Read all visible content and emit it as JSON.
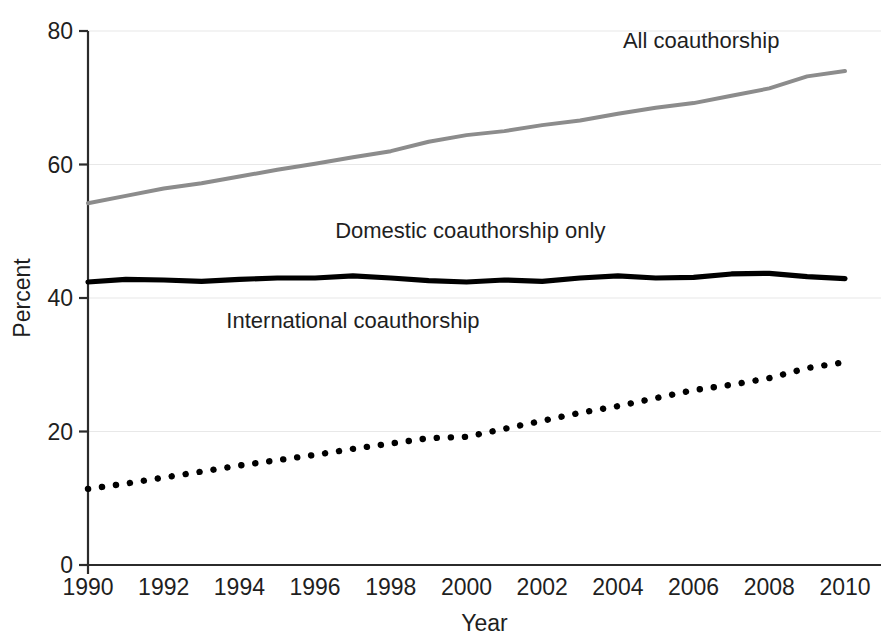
{
  "chart_data": {
    "type": "line",
    "title": "",
    "xlabel": "Year",
    "ylabel": "Percent",
    "xlim": [
      1990,
      2010
    ],
    "ylim": [
      0,
      80
    ],
    "grid": true,
    "legend_position": "inline-annotations",
    "x": [
      1990,
      1991,
      1992,
      1993,
      1994,
      1995,
      1996,
      1997,
      1998,
      1999,
      2000,
      2001,
      2002,
      2003,
      2004,
      2005,
      2006,
      2007,
      2008,
      2009,
      2010
    ],
    "xticks": [
      "1990",
      "1992",
      "1994",
      "1996",
      "1998",
      "2000",
      "2002",
      "2004",
      "2006",
      "2008",
      "2010"
    ],
    "xtick_values": [
      1990,
      1992,
      1994,
      1996,
      1998,
      2000,
      2002,
      2004,
      2006,
      2008,
      2010
    ],
    "yticks": [
      "0",
      "20",
      "40",
      "60",
      "80"
    ],
    "ytick_values": [
      0,
      20,
      40,
      60,
      80
    ],
    "series": [
      {
        "name": "All coauthorship",
        "style": "solid-gray",
        "color": "#8c8c8c",
        "label_x": 2006.2,
        "label_y": 77.5,
        "values": [
          54.2,
          55.3,
          56.4,
          57.2,
          58.2,
          59.2,
          60.1,
          61.1,
          62.0,
          63.4,
          64.4,
          65.0,
          65.9,
          66.6,
          67.6,
          68.5,
          69.2,
          70.3,
          71.4,
          73.2,
          74.0
        ]
      },
      {
        "name": "Domestic coauthorship only",
        "style": "solid-black-thick",
        "color": "#000000",
        "label_x": 2000.1,
        "label_y": 49.0,
        "values": [
          42.4,
          42.8,
          42.7,
          42.5,
          42.8,
          43.0,
          43.0,
          43.3,
          43.0,
          42.6,
          42.4,
          42.7,
          42.5,
          43.0,
          43.3,
          43.0,
          43.1,
          43.6,
          43.7,
          43.2,
          42.9
        ]
      },
      {
        "name": "International coauthorship",
        "style": "dotted-black",
        "color": "#000000",
        "label_x": 1997.0,
        "label_y": 35.5,
        "values": [
          11.4,
          12.2,
          13.1,
          14.0,
          14.9,
          15.7,
          16.5,
          17.4,
          18.2,
          19.0,
          19.2,
          20.4,
          21.6,
          22.8,
          23.8,
          25.0,
          26.2,
          27.0,
          28.0,
          29.5,
          30.4
        ]
      }
    ]
  },
  "axes": {
    "y_title": "Percent",
    "x_title": "Year"
  }
}
